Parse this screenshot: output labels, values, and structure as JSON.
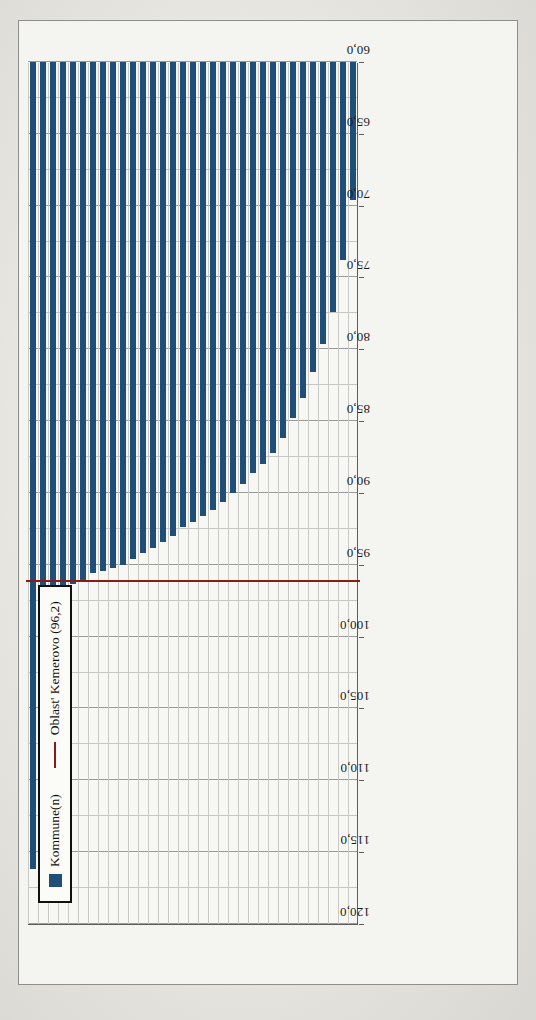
{
  "legend": {
    "position": "top-left",
    "items": [
      {
        "label": "Kommune(n)",
        "marker": "bar-swatch",
        "color": "#1f4e79"
      },
      {
        "label": "Oblast' Kemerovo (96,2)",
        "marker": "line-swatch",
        "color": "#8c1b16"
      }
    ]
  },
  "colors": {
    "bar": "#1f4e79",
    "reference_line": "#8c1b16",
    "grid": "#9a9a9a",
    "plot_background": "#f7f7f4",
    "paper": "#e7e6e1"
  },
  "chart_data": {
    "type": "bar",
    "orientation": "horizontal",
    "title": "",
    "xlabel": "",
    "ylabel": "",
    "xlim": [
      60.0,
      120.0
    ],
    "xticks": [
      "120,0",
      "115,0",
      "110,0",
      "105,0",
      "100,0",
      "95,0",
      "90,0",
      "85,0",
      "80,0",
      "75,0",
      "70,0",
      "65,0",
      "60,0"
    ],
    "xtick_values": [
      120.0,
      115.0,
      110.0,
      105.0,
      100.0,
      95.0,
      90.0,
      85.0,
      80.0,
      75.0,
      70.0,
      65.0,
      60.0
    ],
    "grid": true,
    "legend_position": "top-left",
    "reference_line": {
      "label": "Oblast' Kemerovo (96,2)",
      "value": 96.2,
      "display_value": "96,2"
    },
    "series_name": "Kommune(n)",
    "categories": [
      "Kemerovo Stadt",
      "Kemerovskij Rajon",
      "Myski Stadt",
      "Promyšlennovskij Rajon",
      "Novokuzneckij Rajon",
      "Novokuzneck Stadt",
      "Tajga Stadt",
      "Jurginskij Rajon",
      "Jurga Stadt",
      "Polysaevo Stadt",
      "Berëzovskij Stadt",
      "Taštagol'skij Rajon + Stadt",
      "Meždurečenskij Rajon + Stadt",
      "Krasnobrodskij Rajon + Stadt",
      "Prokop'evskij Rajon",
      "Belovo Stadt",
      "Mariinskij Rajon + Stadt",
      "Prokop'evsk Stadt",
      "Topkinskij Rajon + Stadt",
      "Leninsk-Kuzneckij Rajon + Stadt",
      "Kiselëvsk Stadt",
      "Kaprivinskij Rajon",
      "Kaltan + Osinniki Stadt",
      "Anžero-Sudžensk Stadt",
      "Gur'evskij Rajon (+Stadt)",
      "Jaškinskij Rajon",
      "Čebulinskij Rajon",
      "Belovskij Rajon",
      "Leninsk-Kuzneckij Rajon",
      "Tisul'skij Rajon",
      "Jajskij Rajon",
      "Izmorskij Rajon",
      "Tjažinskij Rajon"
    ],
    "values": [
      116.2,
      104.9,
      98.2,
      98.0,
      96.3,
      96.2,
      95.6,
      95.4,
      95.2,
      95.0,
      94.6,
      94.2,
      93.8,
      93.4,
      93.0,
      92.4,
      92.0,
      91.6,
      91.2,
      90.6,
      90.0,
      89.4,
      88.6,
      88.0,
      87.2,
      86.2,
      84.8,
      83.4,
      81.6,
      79.6,
      77.4,
      73.8,
      69.6
    ]
  }
}
